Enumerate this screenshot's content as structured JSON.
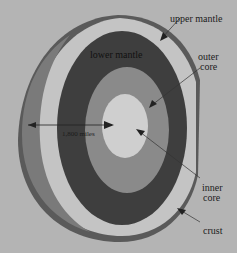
{
  "diagram": {
    "labels": {
      "upper_mantle": "upper mantle",
      "lower_mantle": "lower mantle",
      "outer_core_1": "outer",
      "outer_core_2": "core",
      "inner_core_1": "inner",
      "inner_core_2": "core",
      "crust": "crust",
      "distance": "1,800 miles"
    },
    "colors": {
      "background": "#b4b4b4",
      "crust": "#5a5a5a",
      "upper_mantle": "#c4c4c4",
      "lower_mantle": "#3e3e3e",
      "outer_core": "#8a8a8a",
      "inner_core": "#cfcfcf"
    }
  }
}
